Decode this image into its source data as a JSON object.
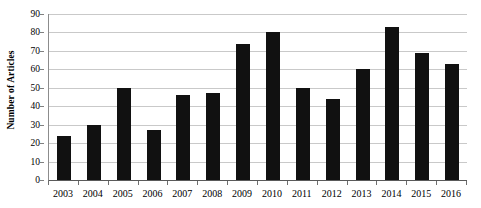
{
  "chart_data": {
    "type": "bar",
    "title": "",
    "xlabel": "",
    "ylabel": "Number of Articles",
    "ylim": [
      0,
      90
    ],
    "ytick_step": 10,
    "yticks": [
      90,
      80,
      70,
      60,
      50,
      40,
      30,
      20,
      10,
      0
    ],
    "grid": true,
    "legend": "none",
    "bar_color": "#111111",
    "gridline_color": "#c9c9c9",
    "axis_color": "#5a5a5a",
    "categories": [
      "2003",
      "2004",
      "2005",
      "2006",
      "2007",
      "2008",
      "2009",
      "2010",
      "2011",
      "2012",
      "2013",
      "2014",
      "2015",
      "2016"
    ],
    "values": [
      24,
      30,
      50,
      27,
      46,
      47,
      74,
      80,
      50,
      44,
      60,
      83,
      69,
      63
    ]
  }
}
